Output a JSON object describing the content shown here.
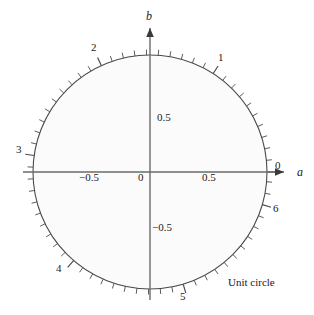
{
  "figure": {
    "caption": "Unit circle",
    "axes": {
      "x_label": "a",
      "y_label": "b"
    },
    "colors": {
      "stroke": "#4a4a4a",
      "circle_stroke": "#4a4a4a",
      "fill": "#fbfbfb",
      "text": "#1a1a1a"
    },
    "axis_tick_labels": {
      "x": [
        {
          "text": "−0.5",
          "value": -0.5
        },
        {
          "text": "0",
          "value": 0
        },
        {
          "text": "0.5",
          "value": 0.5
        }
      ],
      "y": [
        {
          "text": "0.5",
          "value": 0.5
        },
        {
          "text": "−0.5",
          "value": -0.5
        }
      ]
    },
    "radian_labels": [
      {
        "text": "0",
        "value": 0
      },
      {
        "text": "1",
        "value": 1
      },
      {
        "text": "2",
        "value": 2
      },
      {
        "text": "3",
        "value": 3
      },
      {
        "text": "4",
        "value": 4
      },
      {
        "text": "5",
        "value": 5
      },
      {
        "text": "6",
        "value": 6
      }
    ]
  },
  "chart_data": {
    "type": "scatter",
    "title": "Unit circle",
    "subtitle": "",
    "xlabel": "a",
    "ylabel": "b",
    "xlim": [
      -1.15,
      1.15
    ],
    "ylim": [
      -1.15,
      1.15
    ],
    "grid": false,
    "legend": "none",
    "shape": {
      "name": "unit circle",
      "center": [
        0,
        0
      ],
      "radius": 1,
      "equation": "a^2 + b^2 = 1"
    },
    "xticks": [
      -0.5,
      0,
      0.5
    ],
    "xticklabels": [
      "−0.5",
      "0",
      "0.5"
    ],
    "yticks": [
      -0.5,
      0.5
    ],
    "yticklabels": [
      "−0.5",
      "0.5"
    ],
    "arc_tick_interval_radians": 0.1,
    "arc_major_tick_interval_radians": 1.0,
    "arc_tick_count": 63,
    "annotations": [
      {
        "label": "0",
        "radians": 0,
        "a": 1.0,
        "b": 0.0
      },
      {
        "label": "1",
        "radians": 1,
        "a": 0.5403,
        "b": 0.8415
      },
      {
        "label": "2",
        "radians": 2,
        "a": -0.4161,
        "b": 0.9093
      },
      {
        "label": "3",
        "radians": 3,
        "a": -0.99,
        "b": 0.1411
      },
      {
        "label": "4",
        "radians": 4,
        "a": -0.6536,
        "b": -0.7568
      },
      {
        "label": "5",
        "radians": 5,
        "a": 0.2837,
        "b": -0.9589
      },
      {
        "label": "6",
        "radians": 6,
        "a": 0.9602,
        "b": -0.2794
      }
    ]
  }
}
